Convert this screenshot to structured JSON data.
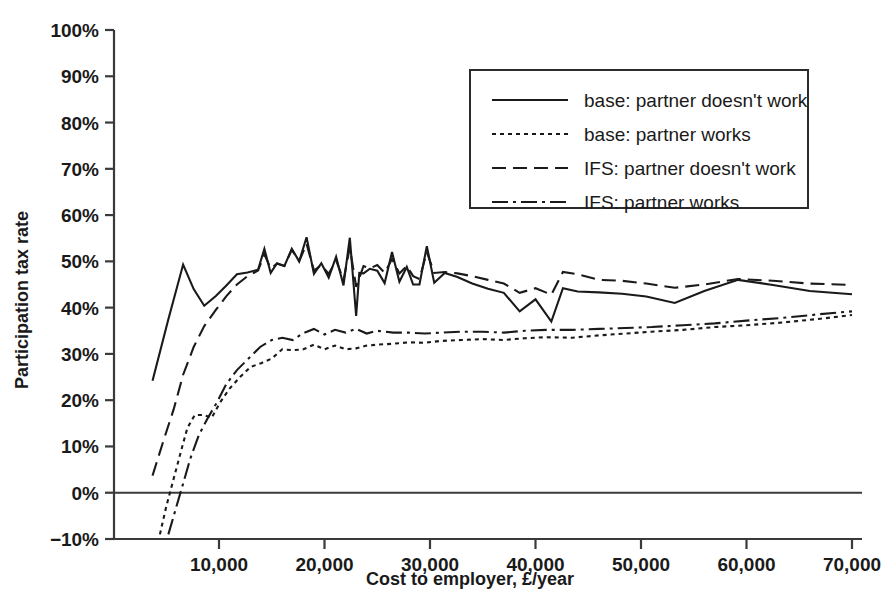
{
  "chart_data": {
    "type": "line",
    "title": "",
    "xlabel": "Cost to employer, £/year",
    "ylabel": "Participation tax rate",
    "xlim": [
      3000,
      70000
    ],
    "ylim": [
      -10,
      100
    ],
    "grid": false,
    "legend_position": "top-right",
    "x_ticks": [
      {
        "value": 10000,
        "label": "10,000"
      },
      {
        "value": 20000,
        "label": "20,000"
      },
      {
        "value": 30000,
        "label": "30,000"
      },
      {
        "value": 40000,
        "label": "40,000"
      },
      {
        "value": 50000,
        "label": "50,000"
      },
      {
        "value": 60000,
        "label": "60,000"
      },
      {
        "value": 70000,
        "label": "70,000"
      }
    ],
    "y_ticks": [
      {
        "value": -10,
        "label": "−10%"
      },
      {
        "value": 0,
        "label": "0%"
      },
      {
        "value": 10,
        "label": "10%"
      },
      {
        "value": 20,
        "label": "20%"
      },
      {
        "value": 30,
        "label": "30%"
      },
      {
        "value": 40,
        "label": "40%"
      },
      {
        "value": 50,
        "label": "50%"
      },
      {
        "value": 60,
        "label": "60%"
      },
      {
        "value": 70,
        "label": "70%"
      },
      {
        "value": 80,
        "label": "80%"
      },
      {
        "value": 90,
        "label": "90%"
      },
      {
        "value": 100,
        "label": "100%"
      }
    ],
    "series": [
      {
        "name": "base: partner doesn't work",
        "dash": "none",
        "x": [
          3700,
          5200,
          6600,
          7600,
          8600,
          9700,
          10700,
          11700,
          12700,
          13700,
          14300,
          14900,
          15500,
          16200,
          16900,
          17600,
          18300,
          19000,
          19700,
          20400,
          21100,
          21800,
          22400,
          23000,
          23300,
          23700,
          24300,
          25000,
          25700,
          26400,
          27100,
          27800,
          28400,
          29000,
          29700,
          30400,
          31400,
          32600,
          34000,
          35500,
          37000,
          38500,
          40000,
          41500,
          42600,
          44000,
          46000,
          48200,
          50500,
          53200,
          56000,
          59200,
          62500,
          66000,
          70000
        ],
        "y": [
          24.2,
          37.5,
          49.3,
          44.0,
          40.4,
          42.5,
          44.8,
          47.2,
          47.6,
          48.2,
          52.7,
          47.5,
          49.6,
          49.0,
          52.7,
          50.0,
          55.2,
          47.3,
          49.6,
          46.5,
          51.0,
          44.8,
          55.1,
          38.2,
          47.5,
          47.4,
          48.4,
          48.0,
          45.3,
          52.0,
          45.6,
          48.8,
          45.0,
          45.0,
          53.3,
          45.4,
          47.5,
          46.6,
          45.2,
          44.1,
          43.2,
          39.2,
          41.8,
          37.0,
          44.2,
          43.5,
          43.3,
          43.0,
          42.4,
          41.0,
          43.6,
          46.0,
          44.9,
          43.6,
          42.9
        ]
      },
      {
        "name": "base: partner works",
        "dash": "dotted",
        "x": [
          4400,
          5000,
          5700,
          6400,
          7000,
          7700,
          8500,
          9300,
          10100,
          11000,
          12000,
          13000,
          14000,
          15000,
          16000,
          17000,
          18000,
          19000,
          20000,
          21000,
          22000,
          23000,
          24000,
          25000,
          26500,
          28000,
          29500,
          31000,
          33000,
          35000,
          37000,
          39000,
          41000,
          43500,
          46000,
          48500,
          51000,
          54000,
          57000,
          60000,
          63500,
          67000,
          70000
        ],
        "y": [
          -9.0,
          -3.0,
          3.0,
          9.0,
          14.0,
          16.8,
          16.8,
          16.2,
          19.5,
          22.5,
          25.0,
          27.2,
          28.0,
          29.0,
          31.0,
          30.8,
          31.0,
          32.0,
          31.0,
          31.8,
          31.0,
          31.2,
          31.8,
          32.0,
          32.2,
          32.5,
          32.4,
          32.8,
          33.0,
          33.2,
          33.0,
          33.4,
          33.6,
          33.5,
          34.0,
          34.4,
          34.8,
          35.2,
          35.8,
          36.2,
          36.8,
          37.6,
          38.4
        ]
      },
      {
        "name": "IFS: partner doesn't work",
        "dash": "dashed",
        "x": [
          3700,
          4700,
          5700,
          6600,
          7600,
          8600,
          9700,
          10700,
          11700,
          12700,
          13700,
          14300,
          14900,
          15500,
          16200,
          16900,
          17600,
          18300,
          19000,
          19700,
          20400,
          21100,
          21800,
          22400,
          23000,
          23700,
          24300,
          25000,
          25700,
          26400,
          27100,
          27800,
          28400,
          29000,
          29700,
          30400,
          31400,
          32600,
          34000,
          35500,
          37000,
          38500,
          40000,
          41500,
          42600,
          44000,
          46000,
          48200,
          50500,
          53200,
          56000,
          59200,
          62500,
          66000,
          70000
        ],
        "y": [
          3.7,
          11.0,
          18.0,
          25.5,
          31.5,
          36.0,
          39.5,
          42.5,
          45.0,
          46.8,
          48.0,
          51.5,
          48.5,
          49.5,
          49.0,
          52.5,
          50.0,
          53.8,
          48.0,
          49.2,
          47.3,
          50.2,
          46.0,
          53.0,
          44.5,
          49.0,
          48.5,
          49.2,
          47.5,
          50.5,
          47.4,
          49.0,
          46.8,
          46.2,
          52.0,
          47.5,
          47.7,
          47.4,
          46.8,
          46.0,
          45.2,
          43.2,
          44.2,
          42.8,
          47.7,
          47.2,
          46.0,
          45.8,
          45.2,
          44.3,
          45.0,
          46.2,
          45.8,
          45.2,
          44.9
        ]
      },
      {
        "name": "IFS: partner works",
        "dash": "dashdot",
        "x": [
          5200,
          5900,
          6600,
          7300,
          8100,
          8900,
          9800,
          10700,
          11700,
          12800,
          13900,
          15000,
          16000,
          17000,
          18000,
          19000,
          20000,
          21000,
          22000,
          23000,
          24000,
          25000,
          26500,
          28000,
          29500,
          31000,
          33000,
          35000,
          37000,
          39000,
          41000,
          43500,
          46000,
          48500,
          51000,
          54000,
          57000,
          60000,
          63500,
          67000,
          70000
        ],
        "y": [
          -9.0,
          -3.5,
          2.0,
          7.5,
          12.5,
          16.0,
          19.5,
          23.5,
          26.5,
          29.0,
          31.5,
          33.0,
          33.5,
          33.0,
          34.5,
          35.4,
          34.2,
          35.2,
          34.6,
          35.4,
          34.4,
          35.0,
          34.6,
          34.6,
          34.4,
          34.6,
          34.8,
          34.8,
          34.6,
          35.0,
          35.2,
          35.2,
          35.4,
          35.6,
          35.8,
          36.2,
          36.6,
          37.2,
          37.8,
          38.6,
          39.2
        ]
      }
    ]
  },
  "legend": {
    "items": [
      {
        "label": "base: partner doesn't work",
        "dash": "none"
      },
      {
        "label": "base: partner works",
        "dash": "dotted"
      },
      {
        "label": "IFS: partner doesn't work",
        "dash": "dashed"
      },
      {
        "label": "IFS: partner works",
        "dash": "dashdot"
      }
    ]
  },
  "colors": {
    "ink": "#1a1a1a",
    "axis": "#3a3a3a",
    "background": "#ffffff"
  }
}
